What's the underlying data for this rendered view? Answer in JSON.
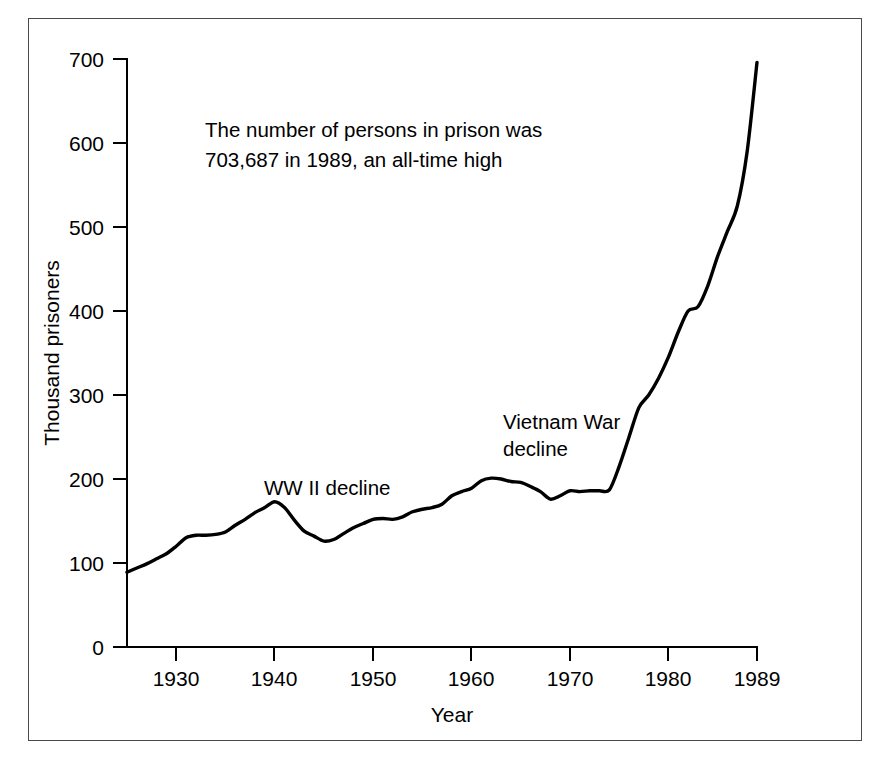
{
  "chart_data": {
    "type": "line",
    "title": "",
    "subtitle": "",
    "xlabel": "Year",
    "ylabel": "Thousand prisoners",
    "xlim": [
      1925,
      1989
    ],
    "ylim": [
      0,
      700
    ],
    "grid": false,
    "legend": "none",
    "x_ticks": [
      "1930",
      "1940",
      "1950",
      "1960",
      "1970",
      "1980",
      "1989"
    ],
    "x_tick_values": [
      1930,
      1940,
      1950,
      1960,
      1970,
      1980,
      1989
    ],
    "y_ticks": [
      "0",
      "100",
      "200",
      "300",
      "400",
      "500",
      "600",
      "700"
    ],
    "y_tick_values": [
      0,
      100,
      200,
      300,
      400,
      500,
      600,
      700
    ],
    "series": [
      {
        "name": "Prisoners",
        "color": "#000000",
        "x": [
          1925,
          1926,
          1927,
          1928,
          1929,
          1930,
          1931,
          1932,
          1933,
          1934,
          1935,
          1936,
          1937,
          1938,
          1939,
          1940,
          1941,
          1942,
          1943,
          1944,
          1945,
          1946,
          1947,
          1948,
          1949,
          1950,
          1951,
          1952,
          1953,
          1954,
          1955,
          1956,
          1957,
          1958,
          1959,
          1960,
          1961,
          1962,
          1963,
          1964,
          1965,
          1966,
          1967,
          1968,
          1969,
          1970,
          1971,
          1972,
          1973,
          1974,
          1975,
          1976,
          1977,
          1978,
          1979,
          1980,
          1981,
          1982,
          1983,
          1984,
          1985,
          1986,
          1987,
          1988,
          1989
        ],
        "values": [
          89,
          94,
          99,
          105,
          111,
          120,
          130,
          133,
          133,
          134,
          137,
          145,
          152,
          160,
          166,
          173,
          166,
          151,
          138,
          132,
          126,
          128,
          135,
          142,
          147,
          152,
          153,
          152,
          155,
          161,
          164,
          166,
          170,
          180,
          185,
          189,
          198,
          201,
          200,
          197,
          196,
          191,
          185,
          176,
          180,
          186,
          185,
          186,
          186,
          187,
          215,
          250,
          285,
          300,
          320,
          345,
          375,
          400,
          405,
          430,
          465,
          495,
          525,
          590,
          696
        ]
      }
    ],
    "annotations": [
      {
        "name": "headline-note",
        "lines": [
          "The number of persons in prison was",
          "703,687 in 1989, an all-time high"
        ]
      },
      {
        "name": "ww2-decline",
        "lines": [
          "WW II decline"
        ]
      },
      {
        "name": "vietnam-war-decline",
        "lines": [
          "Vietnam War",
          "decline"
        ]
      }
    ]
  }
}
